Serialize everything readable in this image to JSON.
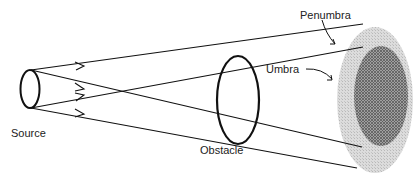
{
  "diagram": {
    "labels": {
      "source": "Source",
      "obstacle": "Obstacle",
      "penumbra": "Penumbra",
      "umbra": "Umbra"
    },
    "colors": {
      "stroke": "#111111",
      "penumbra_fill": "#d9d9d9",
      "penumbra_hatch": "#bdbdbd",
      "umbra_fill": "#9a9a9a",
      "umbra_hatch": "#555555",
      "label_text": "#222222"
    }
  }
}
